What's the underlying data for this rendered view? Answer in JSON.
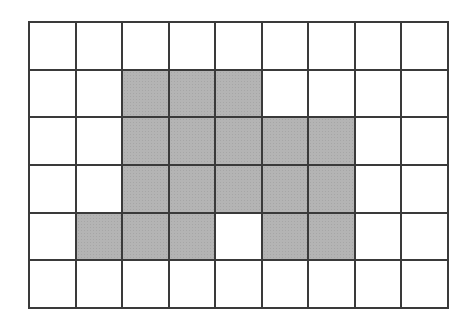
{
  "grid": {
    "rows": 6,
    "cols": 9,
    "colors": {
      "shaded": "#b4b4b4",
      "empty": "#ffffff",
      "line": "#3a3a3a"
    },
    "shaded_cells": [
      [
        1,
        2
      ],
      [
        1,
        3
      ],
      [
        1,
        4
      ],
      [
        2,
        2
      ],
      [
        2,
        3
      ],
      [
        2,
        4
      ],
      [
        2,
        5
      ],
      [
        2,
        6
      ],
      [
        3,
        2
      ],
      [
        3,
        3
      ],
      [
        3,
        4
      ],
      [
        3,
        5
      ],
      [
        3,
        6
      ],
      [
        4,
        1
      ],
      [
        4,
        2
      ],
      [
        4,
        3
      ],
      [
        4,
        5
      ],
      [
        4,
        6
      ]
    ],
    "shaded_count": 18
  }
}
